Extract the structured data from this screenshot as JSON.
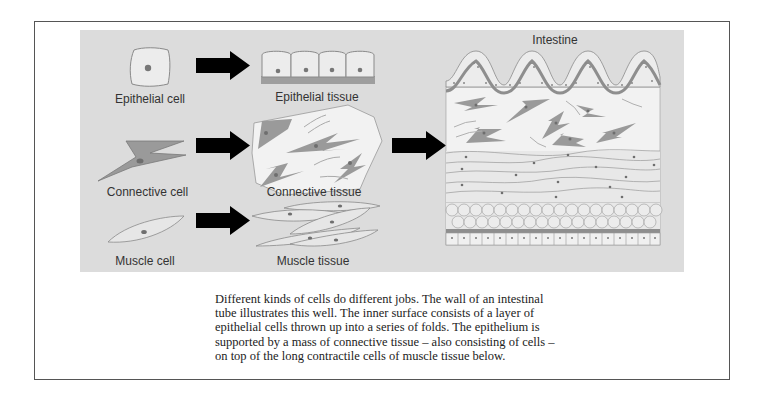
{
  "figure": {
    "labels": {
      "epithelial_cell": "Epithelial cell",
      "epithelial_tissue": "Epithelial tissue",
      "connective_cell": "Connective cell",
      "connective_tissue": "Connective tissue",
      "muscle_cell": "Muscle cell",
      "muscle_tissue": "Muscle tissue",
      "intestine": "Intestine"
    },
    "icons": [
      "arrow-right-icon",
      "epithelial-cell-illustration",
      "connective-cell-illustration",
      "muscle-cell-illustration",
      "intestine-cross-section-illustration"
    ],
    "colors": {
      "panel_background": "#dcdcdc",
      "cell_fill": "#e8e8e8",
      "connective_cell_fill": "#9a9a9a",
      "nucleus": "#777777",
      "arrow": "#000000",
      "frame_border": "#555555"
    }
  },
  "caption": {
    "text": "Different kinds of cells do different jobs. The wall of an intestinal tube illustrates this well. The inner surface consists of a layer of epithelial cells thrown up into a series of folds. The epithelium is supported by a mass of connective tissue – also consisting of cells – on top of the long contractile cells of muscle tissue below."
  }
}
